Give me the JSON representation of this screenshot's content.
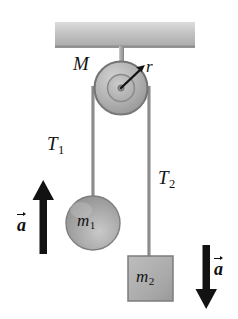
{
  "figure": {
    "width": 238,
    "height": 319,
    "background": "#ffffff"
  },
  "labels": {
    "pulley_mass": "M",
    "pulley_radius": "r",
    "tension_left": "T",
    "tension_left_sub": "1",
    "tension_right": "T",
    "tension_right_sub": "2",
    "mass_left": "m",
    "mass_left_sub": "1",
    "mass_right": "m",
    "mass_right_sub": "2",
    "accel_left": "a",
    "accel_right": "a"
  },
  "colors": {
    "ink": "#131313",
    "ceiling_fill": "#b9b9b9",
    "pulley_fill": "#b0b0b0",
    "pulley_edge": "#6e6e6e",
    "body_fill": "#a9a9a9",
    "body_edge": "#787878",
    "rope": "#8e8e8e",
    "arrow": "#0d0d0d"
  },
  "elements": {
    "ceiling": {
      "x": 55,
      "y": 22,
      "width": 140,
      "height": 26
    },
    "support_rod": {
      "x": 119,
      "y": 48,
      "width": 5,
      "height": 40
    },
    "pulley": {
      "cx": 121,
      "cy": 88,
      "outer_r": 26,
      "inner_r": 13,
      "hub_r": 3
    },
    "radius_arrow": {
      "from_x": 121,
      "from_y": 88,
      "to_x": 142,
      "to_y": 68
    },
    "rope_left": {
      "x": 93,
      "y_top": 88,
      "y_bottom": 196
    },
    "rope_right": {
      "x": 149,
      "y_top": 88,
      "y_bottom": 256
    },
    "sphere_m1": {
      "cx": 93,
      "cy": 223,
      "r": 27
    },
    "block_m2": {
      "x": 128,
      "y": 256,
      "width": 45,
      "height": 45
    },
    "arrow_up": {
      "x": 43,
      "y_tip": 181,
      "y_tail": 254
    },
    "arrow_down": {
      "x": 206,
      "y_tail": 245,
      "y_tip": 309
    }
  }
}
